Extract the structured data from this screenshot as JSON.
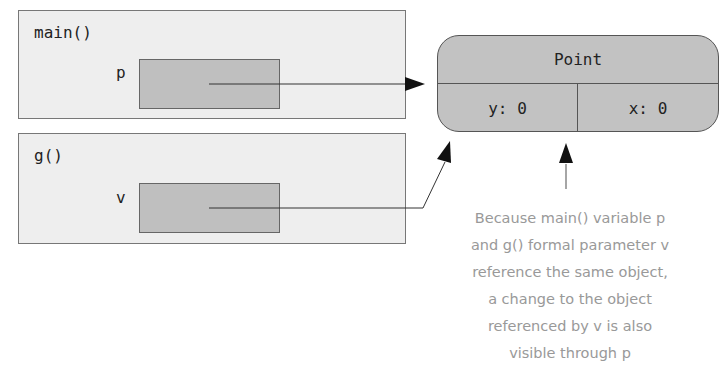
{
  "frames": {
    "main": {
      "label": "main()",
      "variable": "p"
    },
    "g": {
      "label": "g()",
      "variable": "v"
    }
  },
  "object": {
    "class_name": "Point",
    "fields": [
      {
        "text": "y: 0"
      },
      {
        "text": "x: 0"
      }
    ]
  },
  "annotation": {
    "lines": [
      "Because main() variable p",
      "and g() formal parameter v",
      "reference the same object,",
      "a change to the object",
      "referenced by v is also",
      "visible through p"
    ]
  },
  "colors": {
    "frame_bg": "#eeeeee",
    "var_box_bg": "#bfbfbf",
    "object_bg": "#c2c2c2",
    "annotation_text": "#999999"
  }
}
